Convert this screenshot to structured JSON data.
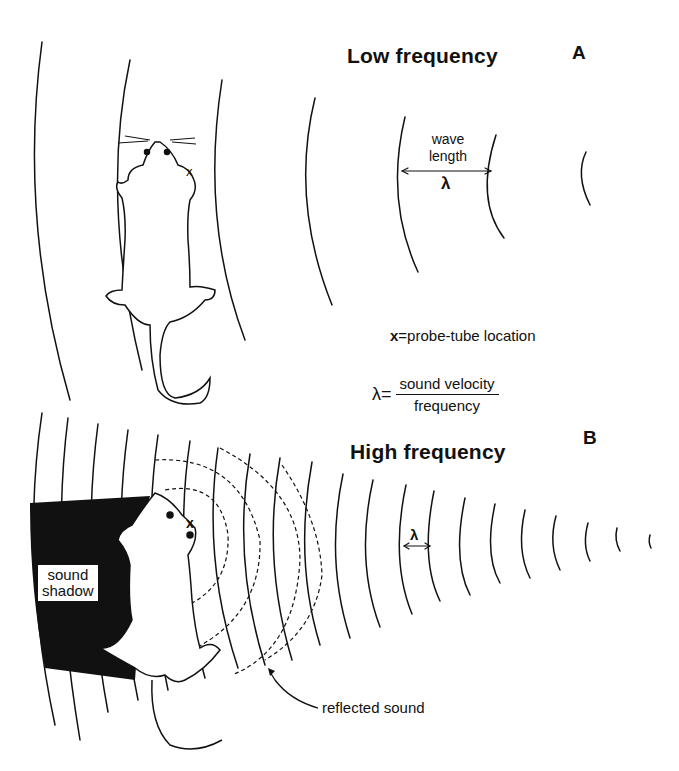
{
  "panel_a": {
    "title": "Low frequency",
    "letter": "A",
    "wavelength_label_line1": "wave",
    "wavelength_label_line2": "length",
    "wavelength_symbol": "λ"
  },
  "legend": {
    "probe_marker": "x",
    "probe_text": "=probe-tube location",
    "formula_lhs": "λ=",
    "formula_numerator": "sound velocity",
    "formula_denominator": "frequency"
  },
  "panel_b": {
    "title": "High frequency",
    "letter": "B",
    "wavelength_symbol": "λ",
    "shadow_label_line1": "sound",
    "shadow_label_line2": "shadow",
    "reflected_label": "reflected sound",
    "probe_marker": "x"
  },
  "colors": {
    "ink": "#111111",
    "background": "#ffffff"
  }
}
